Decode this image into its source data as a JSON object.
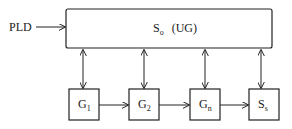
{
  "diagram": {
    "input_label": "PLD",
    "top_box": {
      "label_main": "S",
      "label_sub": "o",
      "label_extra": "(UG)"
    },
    "boxes": [
      {
        "main": "G",
        "sub": "1"
      },
      {
        "main": "G",
        "sub": "2"
      },
      {
        "main": "G",
        "sub": "n"
      },
      {
        "main": "S",
        "sub": "s"
      }
    ],
    "colors": {
      "stroke": "#222222",
      "background": "#ffffff"
    }
  }
}
